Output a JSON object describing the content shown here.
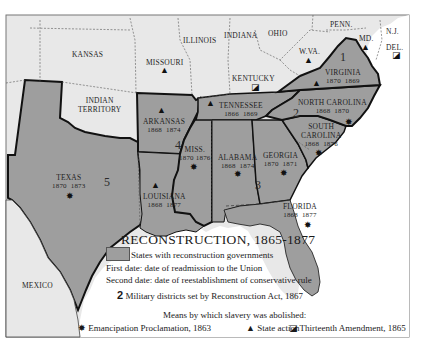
{
  "map": {
    "title": "RECONSTRUCTION, 1865-1877",
    "colors": {
      "reconstruction_states": "#9e9e9e",
      "other_states": "#e8e8e8",
      "water": "#ffffff",
      "borders": "#111111"
    },
    "regions": [
      {
        "name": "KANSAS",
        "type": "other"
      },
      {
        "name": "MISSOURI",
        "type": "other",
        "symbol": "state-action"
      },
      {
        "name": "ILLINOIS",
        "type": "other"
      },
      {
        "name": "INDIANA",
        "type": "other"
      },
      {
        "name": "OHIO",
        "type": "other"
      },
      {
        "name": "PENN.",
        "type": "other"
      },
      {
        "name": "N.J.",
        "type": "other"
      },
      {
        "name": "DEL.",
        "type": "other",
        "symbol": "thirteenth-amendment"
      },
      {
        "name": "MD.",
        "type": "other",
        "symbol": "state-action"
      },
      {
        "name": "W.VA.",
        "type": "other",
        "symbol": "state-action"
      },
      {
        "name": "KENTUCKY",
        "type": "other",
        "symbol": "thirteenth-amendment"
      },
      {
        "name": "INDIAN TERRITORY",
        "line1": "INDIAN",
        "line2": "TERRITORY",
        "type": "other"
      },
      {
        "name": "MEXICO",
        "type": "other"
      },
      {
        "name": "VIRGINIA",
        "type": "reconstruction",
        "readmitted": "1870",
        "conservative": "1869",
        "symbol": "state-action",
        "district": "1"
      },
      {
        "name": "NORTH CAROLINA",
        "type": "reconstruction",
        "readmitted": "1868",
        "conservative": "1870",
        "symbol": "emancipation",
        "district": "2"
      },
      {
        "name": "SOUTH CAROLINA",
        "line1": "SOUTH",
        "line2": "CAROLINA",
        "type": "reconstruction",
        "readmitted": "1868",
        "conservative": "1876",
        "symbol": "emancipation",
        "district": "2"
      },
      {
        "name": "GEORGIA",
        "type": "reconstruction",
        "readmitted": "1870",
        "conservative": "1871",
        "symbol": "emancipation",
        "district": "3"
      },
      {
        "name": "FLORIDA",
        "type": "reconstruction",
        "readmitted": "1868",
        "conservative": "1877",
        "symbol": "emancipation",
        "district": "3"
      },
      {
        "name": "ALABAMA",
        "type": "reconstruction",
        "readmitted": "1868",
        "conservative": "1874",
        "symbol": "emancipation",
        "district": "3"
      },
      {
        "name": "TENNESSEE",
        "type": "reconstruction",
        "readmitted": "1866",
        "conservative": "1869",
        "symbol": "state-action"
      },
      {
        "name": "MISS.",
        "type": "reconstruction",
        "readmitted": "1870",
        "conservative": "1876",
        "symbol": "emancipation",
        "district": "4"
      },
      {
        "name": "ARKANSAS",
        "type": "reconstruction",
        "readmitted": "1868",
        "conservative": "1874",
        "symbol": "state-action",
        "district": "4"
      },
      {
        "name": "LOUISIANA",
        "type": "reconstruction",
        "readmitted": "1868",
        "conservative": "1877",
        "symbol": "state-action",
        "district": "5"
      },
      {
        "name": "TEXAS",
        "type": "reconstruction",
        "readmitted": "1870",
        "conservative": "1873",
        "symbol": "emancipation",
        "district": "5"
      }
    ],
    "districts": [
      "1",
      "2",
      "3",
      "4",
      "5"
    ]
  },
  "legend": {
    "title": "RECONSTRUCTION, 1865-1877",
    "swatch_label": "States with reconstruction governments",
    "first_date": "First date: date of readmission to the Union",
    "second_date": "Second date: date of reestablishment of conservative rule",
    "district_number": "2",
    "district_label": "Military districts set by Reconstruction Act, 1867",
    "means_heading": "Means by which slavery was abolished:",
    "symbols": [
      {
        "icon": "emancipation-star-icon",
        "glyph": "✸",
        "label": "Emancipation Proclamation, 1863"
      },
      {
        "icon": "state-action-triangle-icon",
        "glyph": "▲",
        "label": "State action"
      },
      {
        "icon": "thirteenth-amendment-square-icon",
        "glyph": "◪",
        "label": "Thirteenth Amendment, 1865"
      }
    ]
  }
}
